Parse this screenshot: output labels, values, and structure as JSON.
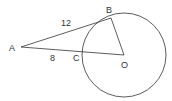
{
  "diagram": {
    "type": "geometry",
    "points": {
      "A": {
        "label": "A",
        "x": 21,
        "y": 47
      },
      "B": {
        "label": "B",
        "x": 111,
        "y": 18
      },
      "C": {
        "label": "C",
        "x": 83,
        "y": 53
      },
      "O": {
        "label": "O",
        "x": 124,
        "y": 55
      }
    },
    "circle": {
      "center": "O",
      "radius": 42
    },
    "segments": [
      {
        "from": "A",
        "to": "B",
        "length_label": "12"
      },
      {
        "from": "A",
        "to": "O",
        "length_label": "8",
        "label_segment": "AC"
      },
      {
        "from": "B",
        "to": "O"
      }
    ],
    "labels": {
      "A": "A",
      "B": "B",
      "C": "C",
      "O": "O",
      "AB": "12",
      "AC": "8"
    },
    "stroke_color": "#333333"
  }
}
